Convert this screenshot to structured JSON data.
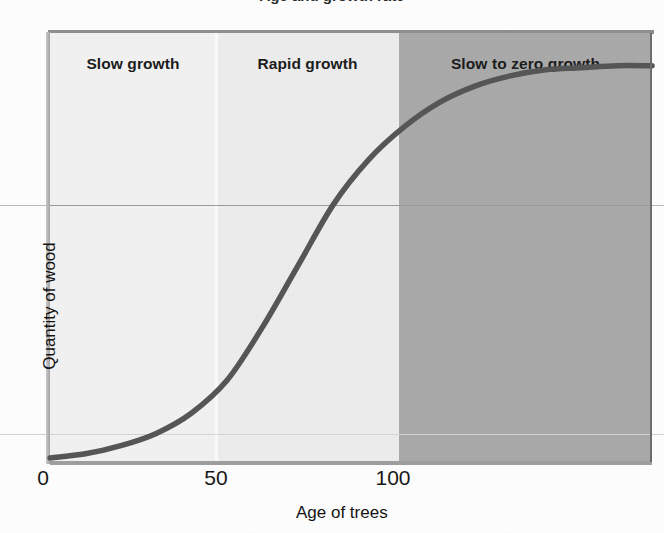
{
  "figure": {
    "cut_title": "Age and growth rate"
  },
  "axes": {
    "x_title": "Age of trees",
    "y_title": "Quantity of wood",
    "x_ticks": [
      "0",
      "50",
      "100"
    ]
  },
  "bands": [
    {
      "label": "Slow growth",
      "color": "#f1f1f1"
    },
    {
      "label": "Rapid growth",
      "color": "#ececec"
    },
    {
      "label": "Slow to zero growth",
      "color": "#a9a9a9"
    }
  ],
  "colors": {
    "curve": "#565656",
    "band_light": "#f1f1f1",
    "band_mid": "#ececec",
    "band_dark": "#a9a9a9",
    "gridline": "#9c9c9c",
    "text": "#181818"
  },
  "chart_data": {
    "type": "line",
    "title": "Age and growth rate",
    "xlabel": "Age of trees",
    "ylabel": "Quantity of wood",
    "xlim": [
      0,
      170
    ],
    "ylim": [
      0,
      1.05
    ],
    "grid": true,
    "legend": "none",
    "x_ticks": [
      0,
      50,
      100
    ],
    "y_ticks": [],
    "series": [
      {
        "name": "Quantity of wood",
        "x": [
          0,
          10,
          20,
          30,
          40,
          50,
          60,
          70,
          80,
          90,
          100,
          110,
          120,
          130,
          140,
          150,
          160,
          170
        ],
        "values": [
          0.01,
          0.02,
          0.04,
          0.07,
          0.12,
          0.2,
          0.33,
          0.48,
          0.63,
          0.74,
          0.82,
          0.88,
          0.92,
          0.945,
          0.96,
          0.965,
          0.97,
          0.97
        ]
      }
    ],
    "annotations": [
      {
        "text": "Slow growth",
        "x_range": [
          0,
          50
        ],
        "shading": "#f1f1f1"
      },
      {
        "text": "Rapid growth",
        "x_range": [
          50,
          100
        ],
        "shading": "#ececec"
      },
      {
        "text": "Slow to zero growth",
        "x_range": [
          100,
          170
        ],
        "shading": "#a9a9a9"
      }
    ]
  }
}
